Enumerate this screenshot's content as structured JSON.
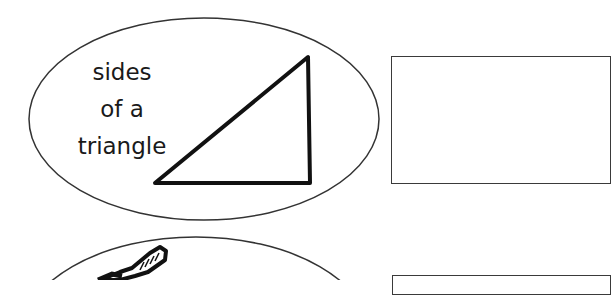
{
  "worksheet": {
    "items": [
      {
        "label_lines": [
          "sides",
          "of a",
          "triangle"
        ],
        "picture": "right-triangle",
        "answer_box": ""
      },
      {
        "label_lines": [],
        "picture": "toothbrush",
        "answer_box": ""
      }
    ]
  },
  "colors": {
    "stroke": "#222222",
    "box_border": "#3a3a3a",
    "background": "#ffffff"
  }
}
